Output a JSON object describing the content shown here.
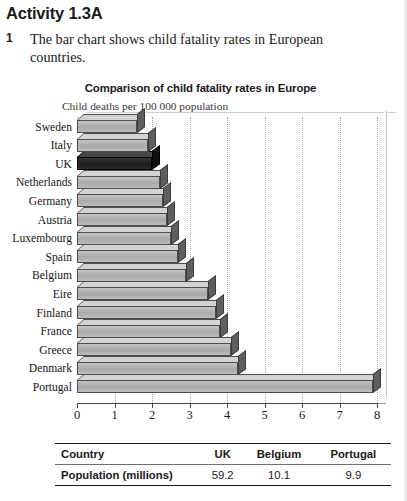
{
  "heading": "Activity 1.3A",
  "question": {
    "number": "1",
    "text": "The bar chart shows child fatality rates in European countries."
  },
  "chart_data": {
    "type": "bar",
    "orientation": "horizontal",
    "title": "Comparison of child fatality rates in Europe",
    "subtitle": "Child deaths per 100 000 population",
    "xlabel": "",
    "ylabel": "",
    "xlim": [
      0,
      8
    ],
    "xticks": [
      "0",
      "1",
      "2",
      "3",
      "4",
      "5",
      "6",
      "7",
      "8"
    ],
    "grid": true,
    "legend": false,
    "highlight_category": "UK",
    "highlight_color": "#1d1d1d",
    "bar_color": "#b0b0b0",
    "categories": [
      "Sweden",
      "Italy",
      "UK",
      "Netherlands",
      "Germany",
      "Austria",
      "Luxembourg",
      "Spain",
      "Belgium",
      "Eire",
      "Finland",
      "France",
      "Greece",
      "Denmark",
      "Portugal"
    ],
    "values": [
      1.6,
      1.9,
      2.0,
      2.2,
      2.3,
      2.4,
      2.5,
      2.7,
      2.9,
      3.5,
      3.7,
      3.8,
      4.1,
      4.3,
      7.9
    ]
  },
  "table": {
    "columns": [
      "Country",
      "UK",
      "Belgium",
      "Portugal"
    ],
    "rows": [
      {
        "label": "Population (millions)",
        "values": [
          "59.2",
          "10.1",
          "9.9"
        ]
      }
    ]
  }
}
